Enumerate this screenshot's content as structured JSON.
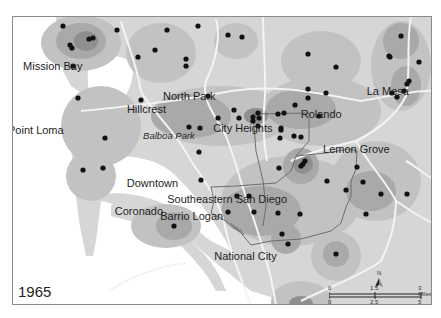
{
  "map": {
    "year": "1965",
    "colors": {
      "land_base": "#d6d6d6",
      "density_low": "#c2c2c2",
      "density_mid": "#a9a9a9",
      "density_high": "#8f8f8f",
      "water": "#ffffff",
      "roads": "#f4f4f4",
      "boundary": "#6e6e6e",
      "points": "#111111",
      "frame": "#8a8a8a"
    },
    "labels": [
      {
        "name": "Mission Bay",
        "x": 54,
        "y": 66,
        "style": "normal"
      },
      {
        "name": "Point Loma",
        "x": 36,
        "y": 130,
        "style": "normal"
      },
      {
        "name": "Hillcrest",
        "x": 152,
        "y": 109,
        "style": "normal"
      },
      {
        "name": "Balboa Park",
        "x": 174,
        "y": 136,
        "style": "italic"
      },
      {
        "name": "North Park",
        "x": 191,
        "y": 96,
        "style": "normal"
      },
      {
        "name": "City Heights",
        "x": 247,
        "y": 128,
        "style": "normal"
      },
      {
        "name": "Rolando",
        "x": 320,
        "y": 114,
        "style": "normal"
      },
      {
        "name": "La Mesa",
        "x": 386,
        "y": 91,
        "style": "normal"
      },
      {
        "name": "Lemon Grove",
        "x": 354,
        "y": 149,
        "style": "normal"
      },
      {
        "name": "Downtown",
        "x": 149,
        "y": 183,
        "style": "normal"
      },
      {
        "name": "Southeastern San Diego",
        "x": 230,
        "y": 199,
        "style": "normal"
      },
      {
        "name": "Coronado",
        "x": 137,
        "y": 211,
        "style": "normal"
      },
      {
        "name": "Barrio Logan",
        "x": 194,
        "y": 216,
        "style": "normal"
      },
      {
        "name": "National City",
        "x": 251,
        "y": 256,
        "style": "normal"
      }
    ],
    "points": [
      [
        62,
        25
      ],
      [
        88,
        38
      ],
      [
        92,
        37
      ],
      [
        69,
        44
      ],
      [
        71,
        47
      ],
      [
        116,
        29
      ],
      [
        166,
        29
      ],
      [
        197,
        25
      ],
      [
        72,
        65
      ],
      [
        137,
        56
      ],
      [
        154,
        49
      ],
      [
        185,
        58
      ],
      [
        185,
        65
      ],
      [
        227,
        34
      ],
      [
        241,
        36
      ],
      [
        307,
        53
      ],
      [
        335,
        66
      ],
      [
        400,
        35
      ],
      [
        388,
        55
      ],
      [
        389,
        56
      ],
      [
        418,
        61
      ],
      [
        207,
        95
      ],
      [
        217,
        117
      ],
      [
        140,
        99
      ],
      [
        188,
        126
      ],
      [
        199,
        127
      ],
      [
        198,
        151
      ],
      [
        233,
        109
      ],
      [
        238,
        117
      ],
      [
        257,
        112
      ],
      [
        258,
        117
      ],
      [
        252,
        116
      ],
      [
        252,
        120
      ],
      [
        277,
        113
      ],
      [
        283,
        112
      ],
      [
        280,
        129
      ],
      [
        280,
        127
      ],
      [
        257,
        125
      ],
      [
        325,
        92
      ],
      [
        307,
        88
      ],
      [
        294,
        104
      ],
      [
        307,
        97
      ],
      [
        318,
        115
      ],
      [
        408,
        80
      ],
      [
        406,
        83
      ],
      [
        403,
        90
      ],
      [
        396,
        96
      ],
      [
        391,
        92
      ],
      [
        279,
        137
      ],
      [
        293,
        135
      ],
      [
        300,
        136
      ],
      [
        278,
        167
      ],
      [
        302,
        163
      ],
      [
        300,
        165
      ],
      [
        304,
        160
      ],
      [
        326,
        180
      ],
      [
        356,
        166
      ],
      [
        362,
        181
      ],
      [
        380,
        193
      ],
      [
        345,
        189
      ],
      [
        365,
        213
      ],
      [
        406,
        193
      ],
      [
        200,
        179
      ],
      [
        236,
        195
      ],
      [
        248,
        195
      ],
      [
        227,
        211
      ],
      [
        277,
        212
      ],
      [
        253,
        211
      ],
      [
        299,
        213
      ],
      [
        281,
        233
      ],
      [
        287,
        243
      ],
      [
        335,
        253
      ],
      [
        82,
        169
      ],
      [
        102,
        167
      ],
      [
        173,
        225
      ],
      [
        77,
        97
      ],
      [
        104,
        137
      ]
    ]
  },
  "scale_bar": {
    "north_label": "N",
    "miles_ticks": [
      "0",
      "1.5",
      "3 Miles"
    ],
    "km_ticks": [
      "0",
      "2.5",
      "5 Kilometers"
    ]
  }
}
